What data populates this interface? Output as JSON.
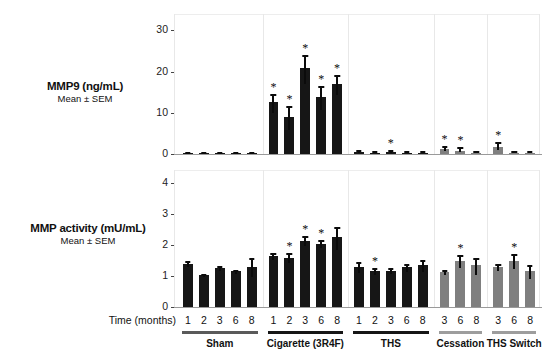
{
  "figure": {
    "time_axis_label": "Time (months)",
    "groups": [
      {
        "name": "Sham",
        "label": "Sham",
        "color": "#5a5a5a",
        "bar_color": "#161616",
        "times": [
          "1",
          "2",
          "3",
          "6",
          "8"
        ]
      },
      {
        "name": "Cigarette",
        "label": "Cigarette (3R4F)",
        "color": "#161616",
        "bar_color": "#161616",
        "times": [
          "1",
          "2",
          "3",
          "6",
          "8"
        ]
      },
      {
        "name": "THS",
        "label": "THS",
        "color": "#161616",
        "bar_color": "#161616",
        "times": [
          "1",
          "2",
          "3",
          "6",
          "8"
        ]
      },
      {
        "name": "Cessation",
        "label": "Cessation",
        "color": "#9d9d9d",
        "bar_color": "#7f7f7f",
        "times": [
          "3",
          "6",
          "8"
        ]
      },
      {
        "name": "THS Switch",
        "label": "THS Switch",
        "color": "#9d9d9d",
        "bar_color": "#7f7f7f",
        "times": [
          "3",
          "6",
          "8"
        ]
      }
    ]
  },
  "chart_data": [
    {
      "type": "bar",
      "panel": "top",
      "title": "MMP9 (ng/mL)",
      "subtitle": "Mean ± SEM",
      "ylabel": "MMP9 (ng/mL)",
      "xlabel": "Time (months)",
      "ylim": [
        0,
        33
      ],
      "yticks": [
        0,
        10,
        20,
        30
      ],
      "ytick_labels": [
        "0",
        "10",
        "20",
        "30"
      ],
      "grid": false,
      "legend": "none",
      "categories": [
        "Sham 1",
        "Sham 2",
        "Sham 3",
        "Sham 6",
        "Sham 8",
        "Cigarette 1",
        "Cigarette 2",
        "Cigarette 3",
        "Cigarette 6",
        "Cigarette 8",
        "THS 1",
        "THS 2",
        "THS 3",
        "THS 6",
        "THS 8",
        "Cessation 3",
        "Cessation 6",
        "Cessation 8",
        "THS Switch 3",
        "THS Switch 6",
        "THS Switch 8"
      ],
      "values": [
        0.3,
        0.2,
        0.3,
        0.2,
        0.3,
        12.5,
        9.0,
        20.8,
        13.8,
        17.0,
        0.5,
        0.3,
        0.4,
        0.3,
        0.3,
        1.1,
        0.8,
        0.3,
        1.8,
        0.3,
        0.3
      ],
      "errors": [
        0.15,
        0.1,
        0.15,
        0.1,
        0.15,
        2.1,
        2.6,
        3.2,
        2.6,
        2.2,
        0.5,
        0.35,
        0.6,
        0.4,
        0.4,
        0.9,
        0.8,
        0.4,
        1.1,
        0.45,
        0.5
      ],
      "significance": [
        "",
        "",
        "",
        "",
        "",
        "*",
        "*",
        "*",
        "*",
        "*",
        "",
        "",
        "*",
        "",
        "",
        "*",
        "*",
        "",
        "*",
        "",
        ""
      ]
    },
    {
      "type": "bar",
      "panel": "bottom",
      "title": "MMP activity (mU/mL)",
      "subtitle": "Mean ± SEM",
      "ylabel": "MMP activity (mU/mL)",
      "xlabel": "Time (months)",
      "ylim": [
        0,
        4.3
      ],
      "yticks": [
        0,
        1,
        2,
        3,
        4
      ],
      "ytick_labels": [
        "0",
        "1",
        "2",
        "3",
        "4"
      ],
      "grid": false,
      "legend": "none",
      "categories": [
        "Sham 1",
        "Sham 2",
        "Sham 3",
        "Sham 6",
        "Sham 8",
        "Cigarette 1",
        "Cigarette 2",
        "Cigarette 3",
        "Cigarette 6",
        "Cigarette 8",
        "THS 1",
        "THS 2",
        "THS 3",
        "THS 6",
        "THS 8",
        "Cessation 3",
        "Cessation 6",
        "Cessation 8",
        "THS Switch 3",
        "THS Switch 6",
        "THS Switch 8"
      ],
      "values": [
        1.4,
        1.03,
        1.25,
        1.15,
        1.3,
        1.65,
        1.6,
        2.15,
        2.05,
        2.25,
        1.3,
        1.15,
        1.18,
        1.28,
        1.35,
        1.13,
        1.5,
        1.35,
        1.28,
        1.5,
        1.15
      ],
      "errors": [
        0.1,
        0.05,
        0.06,
        0.06,
        0.28,
        0.1,
        0.14,
        0.15,
        0.13,
        0.33,
        0.16,
        0.1,
        0.09,
        0.12,
        0.18,
        0.08,
        0.19,
        0.25,
        0.1,
        0.22,
        0.2
      ],
      "significance": [
        "",
        "",
        "",
        "",
        "",
        "",
        "*",
        "*",
        "*",
        "",
        "",
        "*",
        "",
        "",
        "",
        "",
        "*",
        "",
        "",
        "*",
        ""
      ]
    }
  ]
}
